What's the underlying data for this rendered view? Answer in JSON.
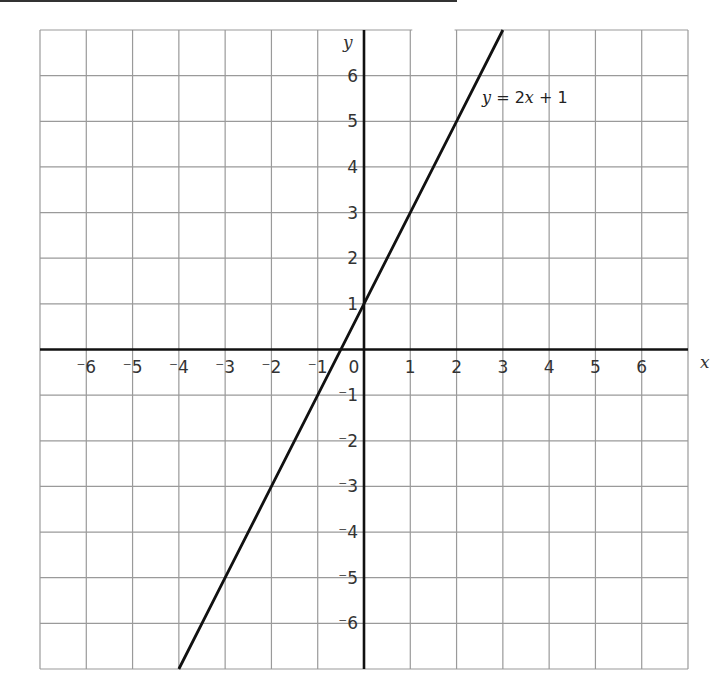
{
  "chart_data": {
    "type": "line",
    "title": "",
    "xlabel": "x",
    "ylabel": "y",
    "xlim": [
      -7,
      7
    ],
    "ylim": [
      -7,
      7
    ],
    "grid": true,
    "x_ticks": [
      -6,
      -5,
      -4,
      -3,
      -2,
      -1,
      0,
      1,
      2,
      3,
      4,
      5,
      6
    ],
    "y_ticks": [
      -6,
      -5,
      -4,
      -3,
      -2,
      -1,
      1,
      2,
      3,
      4,
      5,
      6
    ],
    "x_tick_labels": [
      "⁻6",
      "⁻5",
      "⁻4",
      "⁻3",
      "⁻2",
      "⁻1",
      "0",
      "1",
      "2",
      "3",
      "4",
      "5",
      "6"
    ],
    "y_tick_labels": [
      "⁻6",
      "⁻5",
      "⁻4",
      "⁻3",
      "⁻2",
      "⁻1",
      "1",
      "2",
      "3",
      "4",
      "5",
      "6"
    ],
    "series": [
      {
        "name": "y = 2x + 1",
        "equation": "y = 2x + 1",
        "x": [
          -4,
          -3,
          -2,
          -1,
          0,
          1,
          2,
          3
        ],
        "values": [
          -7,
          -5,
          -3,
          -1,
          1,
          3,
          5,
          7
        ]
      }
    ],
    "annotations": [
      {
        "text": "y = 2x + 1",
        "x": 3,
        "y": 5.8
      }
    ],
    "colors": {
      "grid": "#9a9a9a",
      "axes": "#111111",
      "line": "#111111"
    }
  }
}
